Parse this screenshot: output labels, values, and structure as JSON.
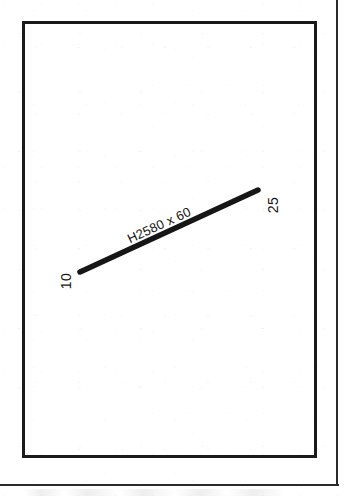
{
  "drawing": {
    "background_color": "#ffffff",
    "ink_color": "#161616",
    "border": {
      "name": "drawing-border-rectangle",
      "stroke_color": "#1a1a1a"
    },
    "sheet_frame": {
      "name": "sheet-outer-frame",
      "stroke_color": "#2b2b2b"
    },
    "members": [
      {
        "label": "H2580 x 60",
        "start_node": "10",
        "end_node": "25",
        "x1": 80,
        "y1": 272,
        "x2": 258,
        "y2": 190,
        "stroke_color": "#161616",
        "stroke_width": 5.5,
        "angle_deg": -24.7
      }
    ],
    "nodes": [
      {
        "label": "10",
        "x": 58,
        "y": 274,
        "rotation_deg": -90
      },
      {
        "label": "25",
        "x": 265,
        "y": 198,
        "rotation_deg": -90
      }
    ]
  }
}
